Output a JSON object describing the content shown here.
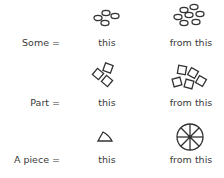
{
  "rows": [
    {
      "label": "Some =",
      "this_caption": "this",
      "from_caption": "from this",
      "this_icon": "four-small-ovals",
      "from_icon": "seven-small-ovals"
    },
    {
      "label": "Part =",
      "this_caption": "this",
      "from_caption": "from this",
      "this_icon": "three-tilted-squares",
      "from_icon": "five-tilted-squares"
    },
    {
      "label": "A piece =",
      "this_caption": "this",
      "from_caption": "from this",
      "this_icon": "pie-wedge-triangle",
      "from_icon": "circle-divided-into-eight-slices"
    }
  ],
  "colors": {
    "ink": "#333333",
    "text": "#3a3a3a",
    "background": "#ffffff"
  }
}
